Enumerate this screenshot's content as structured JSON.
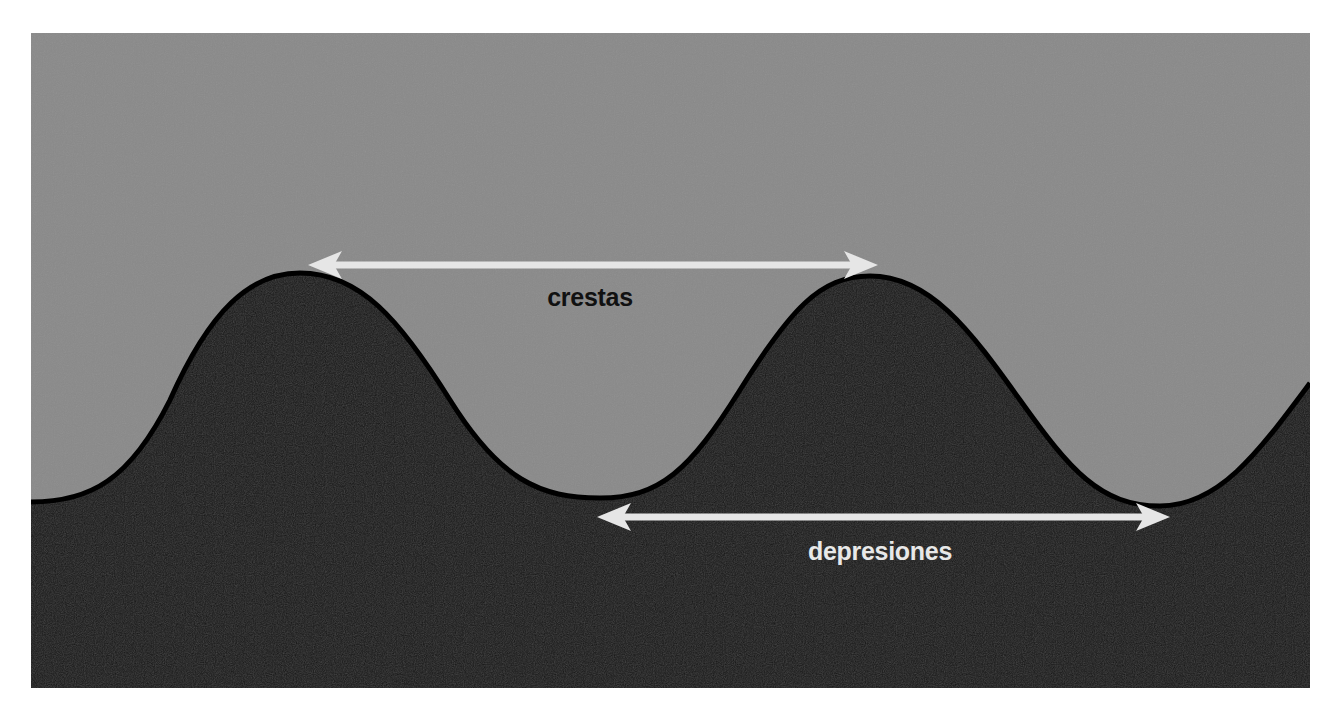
{
  "diagram": {
    "type": "wave-cross-section",
    "colors": {
      "page_background": "#ffffff",
      "air_region": "#8a8a8a",
      "wave_body": "#1c1c1c",
      "wave_outline": "#000000",
      "arrow": "#e6e6e6",
      "crest_label_color": "#111111",
      "trough_label_color": "#e8e8e8"
    },
    "labels": {
      "crest": "crestas",
      "trough": "depresiones"
    },
    "arrows": [
      {
        "name": "crest-to-crest",
        "direction": "double-headed",
        "label_ref": "crest"
      },
      {
        "name": "trough-to-trough",
        "direction": "double-headed",
        "label_ref": "trough"
      }
    ]
  }
}
